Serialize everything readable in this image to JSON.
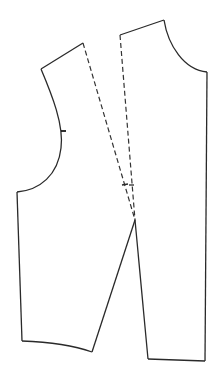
{
  "diagram": {
    "type": "sewing-pattern",
    "colors": {
      "line": "#2a2a2a",
      "background": "#ffffff"
    },
    "pieces": [
      {
        "name": "left-piece",
        "shoulder": [
          [
            41,
            69
          ],
          [
            83,
            43
          ]
        ],
        "armhole_notch": [
          61,
          131
        ],
        "side_seam": [
          [
            17,
            192
          ],
          [
            22,
            341
          ]
        ],
        "hem": [
          [
            22,
            341
          ],
          [
            92,
            352
          ]
        ],
        "slash_line_solid": [
          [
            92,
            352
          ],
          [
            135,
            220
          ]
        ],
        "dart_leg_dashed": [
          [
            83,
            43
          ],
          [
            135,
            220
          ]
        ]
      },
      {
        "name": "right-piece",
        "shoulder": [
          [
            120,
            35
          ],
          [
            164,
            20
          ]
        ],
        "neckline": [
          [
            164,
            20
          ],
          [
            207,
            72
          ]
        ],
        "center_line": [
          [
            207,
            72
          ],
          [
            205,
            361
          ]
        ],
        "hem": [
          [
            148,
            359
          ],
          [
            205,
            361
          ]
        ],
        "slash_line_solid": [
          [
            135,
            220
          ],
          [
            148,
            359
          ]
        ],
        "dart_leg_dashed": [
          [
            120,
            35
          ],
          [
            135,
            220
          ]
        ]
      }
    ],
    "dart_apex": [
      135,
      220
    ],
    "cross_marks": [
      [
        126,
        184
      ],
      [
        131,
        185
      ]
    ]
  }
}
